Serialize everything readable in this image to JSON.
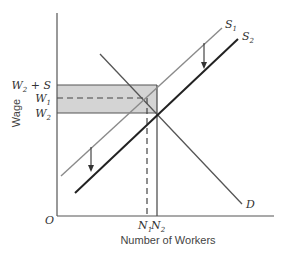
{
  "diagram": {
    "x_axis_label": "Number of Workers",
    "y_axis_label": "Wage",
    "origin_label": "O",
    "y_labels": {
      "w2_plus_s": {
        "main": "W",
        "sub": "2",
        "suffix": " + S"
      },
      "w1": {
        "main": "W",
        "sub": "1"
      },
      "w2": {
        "main": "W",
        "sub": "2"
      }
    },
    "x_labels": {
      "n1": {
        "main": "N",
        "sub": "1"
      },
      "n2": {
        "main": "N",
        "sub": "2"
      }
    },
    "curves": {
      "s1": {
        "main": "S",
        "sub": "1"
      },
      "s2": {
        "main": "S",
        "sub": "2"
      },
      "d": {
        "main": "D"
      }
    },
    "colors": {
      "axis": "#555555",
      "s1": "#8a8a8a",
      "s2": "#222222",
      "demand": "#555555",
      "band_fill": "#d4d4d4",
      "band_stroke": "#555555"
    }
  }
}
